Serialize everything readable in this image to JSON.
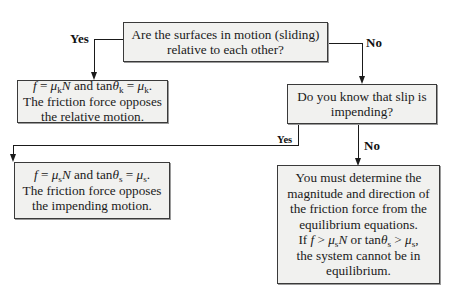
{
  "diagram": {
    "type": "flowchart",
    "nodes": {
      "q_motion": {
        "lines": [
          "Are the surfaces in motion (sliding)",
          "relative to each other?"
        ]
      },
      "kinetic": {
        "eq": {
          "f": "f",
          "eq1": " = ",
          "mu": "μ",
          "sub_k": "k",
          "N": "N",
          "and": " and tan",
          "theta": "θ",
          "eq2": " = ",
          "end": "."
        },
        "lines": [
          "f = μkN and tan θk = μk.",
          "The friction force opposes",
          "the relative motion."
        ]
      },
      "q_impending": {
        "lines": [
          "Do you know that slip is",
          "impending?"
        ]
      },
      "static": {
        "lines": [
          "f = μsN and tan θs = μs.",
          "The friction force opposes",
          "the impending motion."
        ]
      },
      "equilibrium": {
        "lines": [
          "You must determine the",
          "magnitude and direction of",
          "the friction force from the",
          "equilibrium equations.",
          "If f > μsN or tan θs > μs,",
          "the system cannot be in",
          "equilibrium."
        ]
      }
    },
    "edges": [
      {
        "from": "q_motion",
        "to": "kinetic",
        "label": "Yes"
      },
      {
        "from": "q_motion",
        "to": "q_impending",
        "label": "No"
      },
      {
        "from": "q_impending",
        "to": "static",
        "label": "Yes"
      },
      {
        "from": "q_impending",
        "to": "equilibrium",
        "label": "No"
      }
    ],
    "text": {
      "line2_common": "The friction force opposes",
      "kinetic_line3": "the relative motion.",
      "static_line3": "the impending motion.",
      "sub_k": "k",
      "sub_s": "s"
    },
    "colors": {
      "box_fill": "#f1f1ef",
      "stroke": "#1a1a1a"
    }
  }
}
